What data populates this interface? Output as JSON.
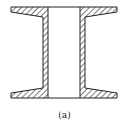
{
  "figure": {
    "caption": "(a)",
    "line_color": "#222222",
    "hatch_color": "#333333",
    "background": "#ffffff"
  }
}
